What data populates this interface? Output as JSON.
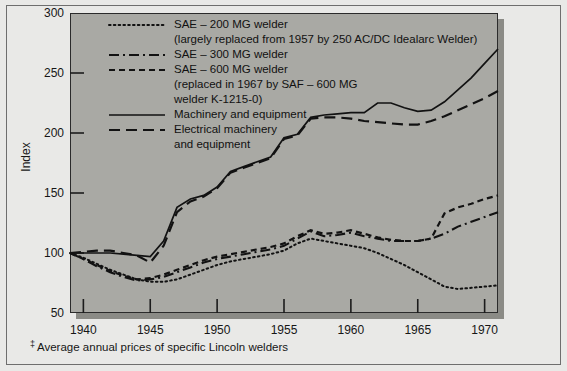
{
  "figure": {
    "ylabel": "Index",
    "footnote_marker": "‡",
    "footnote": "Average annual prices of specific Lincoln welders"
  },
  "legend": {
    "items": [
      {
        "label": "SAE – 200 MG welder",
        "style": "dotted",
        "sublines": [
          "(largely replaced from 1957 by 250 AC/DC Idealarc Welder)"
        ]
      },
      {
        "label": "SAE – 300 MG welder",
        "style": "dash-dot",
        "sublines": []
      },
      {
        "label": "SAE – 600 MG welder",
        "style": "short-dash",
        "sublines": [
          "(replaced in 1967 by SAF – 600 MG",
          "welder K-1215-0)"
        ]
      },
      {
        "label": "Machinery and equipment",
        "style": "solid",
        "sublines": []
      },
      {
        "label": "Electrical machinery",
        "style": "long-dash",
        "sublines": [
          "and equipment"
        ]
      }
    ]
  },
  "chart_data": {
    "type": "line",
    "title": "",
    "xlabel": "",
    "ylabel": "Index",
    "xlim": [
      1939,
      1971
    ],
    "ylim": [
      50,
      300
    ],
    "xticks": [
      1940,
      1945,
      1950,
      1955,
      1960,
      1965,
      1970
    ],
    "yticks": [
      50,
      100,
      150,
      200,
      250,
      300
    ],
    "grid": false,
    "legend_position": "upper-left inside plot",
    "x": [
      1939,
      1940,
      1941,
      1942,
      1943,
      1944,
      1945,
      1946,
      1947,
      1948,
      1949,
      1950,
      1951,
      1952,
      1953,
      1954,
      1955,
      1956,
      1957,
      1958,
      1959,
      1960,
      1961,
      1962,
      1963,
      1964,
      1965,
      1966,
      1967,
      1968,
      1969,
      1970,
      1971
    ],
    "series": [
      {
        "name": "SAE – 200 MG welder",
        "style": "dotted",
        "values": [
          100,
          96,
          91,
          86,
          82,
          78,
          76,
          76,
          78,
          82,
          86,
          90,
          93,
          95,
          97,
          99,
          102,
          108,
          112,
          110,
          108,
          106,
          104,
          100,
          95,
          90,
          84,
          78,
          72,
          70,
          71,
          72,
          73
        ]
      },
      {
        "name": "SAE – 300 MG welder",
        "style": "dash-dot",
        "values": [
          100,
          95,
          89,
          84,
          80,
          77,
          78,
          80,
          84,
          88,
          92,
          95,
          97,
          99,
          101,
          103,
          106,
          112,
          118,
          114,
          115,
          117,
          114,
          112,
          110,
          110,
          110,
          112,
          116,
          122,
          126,
          130,
          134
        ]
      },
      {
        "name": "SAE – 600 MG welder",
        "style": "short-dash",
        "values": [
          100,
          95,
          90,
          85,
          81,
          78,
          79,
          82,
          86,
          90,
          94,
          97,
          99,
          101,
          103,
          105,
          108,
          114,
          119,
          116,
          117,
          119,
          116,
          113,
          111,
          110,
          110,
          112,
          133,
          138,
          141,
          145,
          148
        ]
      },
      {
        "name": "Machinery and equipment",
        "style": "solid",
        "values": [
          100,
          100,
          100,
          100,
          99,
          98,
          97,
          110,
          138,
          145,
          148,
          155,
          168,
          172,
          176,
          180,
          196,
          199,
          213,
          215,
          216,
          217,
          217,
          225,
          225,
          221,
          218,
          219,
          226,
          236,
          246,
          258,
          270
        ]
      },
      {
        "name": "Electrical machinery and equipment",
        "style": "long-dash",
        "values": [
          100,
          101,
          102,
          102,
          100,
          98,
          92,
          106,
          134,
          143,
          147,
          154,
          167,
          171,
          175,
          179,
          195,
          198,
          212,
          213,
          213,
          212,
          210,
          209,
          208,
          207,
          207,
          210,
          214,
          219,
          224,
          229,
          235
        ]
      }
    ]
  }
}
